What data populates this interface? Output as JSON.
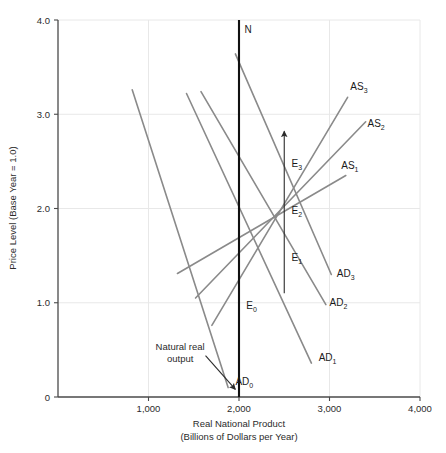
{
  "chart_data": {
    "type": "line",
    "title": "",
    "xlabel": "Real National Product",
    "xlabel_sub": "(Billions of Dollars per Year)",
    "ylabel": "Price Level (Base Year = 1.0)",
    "xlim": [
      0,
      4000
    ],
    "ylim": [
      0,
      4.0
    ],
    "xticks": [
      1000,
      2000,
      3000,
      4000
    ],
    "xtick_labels": [
      "1,000",
      "2,000",
      "3,000",
      "4,000"
    ],
    "yticks": [
      0,
      1.0,
      2.0,
      3.0,
      4.0
    ],
    "ytick_labels": [
      "0",
      "1.0",
      "2.0",
      "3.0",
      "4.0"
    ],
    "grid": true,
    "grid_color": "#e8e8e8",
    "axis_color": "#4a4a4a",
    "curve_color": "#8a8a8a",
    "natural_line_color": "#111111",
    "legend_position": "inline-curve-labels",
    "series": [
      {
        "name": "AD0",
        "label": "AD",
        "subscript": "0",
        "kind": "aggregate-demand",
        "points": [
          [
            820,
            3.26
          ],
          [
            1880,
            0.1
          ]
        ],
        "label_point": [
          1960,
          0.13
        ]
      },
      {
        "name": "AD1",
        "label": "AD",
        "subscript": "1",
        "kind": "aggregate-demand",
        "points": [
          [
            1420,
            3.22
          ],
          [
            2800,
            0.36
          ]
        ],
        "label_point": [
          2880,
          0.38
        ]
      },
      {
        "name": "AD2",
        "label": "AD",
        "subscript": "2",
        "kind": "aggregate-demand",
        "points": [
          [
            1580,
            3.24
          ],
          [
            2960,
            0.98
          ]
        ],
        "label_point": [
          3000,
          0.97
        ]
      },
      {
        "name": "AD3",
        "label": "AD",
        "subscript": "3",
        "kind": "aggregate-demand",
        "points": [
          [
            1960,
            3.64
          ],
          [
            3020,
            1.3
          ]
        ],
        "label_point": [
          3080,
          1.27
        ]
      },
      {
        "name": "AS1",
        "label": "AS",
        "subscript": "1",
        "kind": "aggregate-supply",
        "points": [
          [
            1320,
            1.31
          ],
          [
            3180,
            2.35
          ]
        ],
        "label_point": [
          3130,
          2.42
        ]
      },
      {
        "name": "AS2",
        "label": "AS",
        "subscript": "2",
        "kind": "aggregate-supply",
        "points": [
          [
            1520,
            1.05
          ],
          [
            3400,
            2.92
          ]
        ],
        "label_point": [
          3420,
          2.86
        ]
      },
      {
        "name": "AS3",
        "label": "AS",
        "subscript": "3",
        "kind": "aggregate-supply",
        "points": [
          [
            1700,
            0.76
          ],
          [
            3200,
            3.18
          ]
        ],
        "label_point": [
          3230,
          3.26
        ]
      }
    ],
    "vertical_line": {
      "name": "natural-real-output-line",
      "label": "N",
      "x": 2000,
      "y_from": 0,
      "y_to": 4.0,
      "label_point": [
        2060,
        3.86
      ]
    },
    "equilibria": [
      {
        "name": "E0",
        "label": "E",
        "subscript": "0",
        "x": 2000,
        "y": 1.0,
        "label_point": [
          2080,
          0.93
        ]
      },
      {
        "name": "E1",
        "label": "E",
        "subscript": "1",
        "x": 2500,
        "y": 1.5,
        "label_point": [
          2580,
          1.44
        ]
      },
      {
        "name": "E2",
        "label": "E",
        "subscript": "2",
        "x": 2500,
        "y": 2.0,
        "label_point": [
          2580,
          1.94
        ]
      },
      {
        "name": "E3",
        "label": "E",
        "subscript": "3",
        "x": 2500,
        "y": 2.5,
        "label_point": [
          2580,
          2.44
        ]
      }
    ],
    "arrows": [
      {
        "name": "adjustment-path-arrow",
        "kind": "vertical-up",
        "from": [
          2500,
          1.1
        ],
        "to": [
          2500,
          2.82
        ]
      },
      {
        "name": "natural-real-output-pointer",
        "kind": "annotation-pointer",
        "from": [
          1630,
          0.44
        ],
        "to": [
          1960,
          0.08
        ]
      }
    ],
    "annotations": [
      {
        "name": "natural-real-output-annotation",
        "line1": "Natural real",
        "line2": "output",
        "anchor": [
          1350,
          0.5
        ]
      }
    ]
  }
}
